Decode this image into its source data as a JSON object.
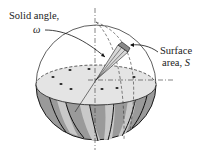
{
  "diagram": {
    "type": "solid-angle-illustration",
    "labels": {
      "solid_angle_line1": "Solid angle,",
      "solid_angle_symbol": "ω",
      "surface_line1": "Surface",
      "surface_line2_prefix": "area, ",
      "surface_symbol": "S"
    },
    "colors": {
      "outline": "#1a1a1a",
      "flesh": "#e4e4e4",
      "rind_dark": "#8f8f8f",
      "rind_light": "#c8c8c8",
      "seeds": "#222222",
      "patch": "#9a9a9a"
    }
  }
}
